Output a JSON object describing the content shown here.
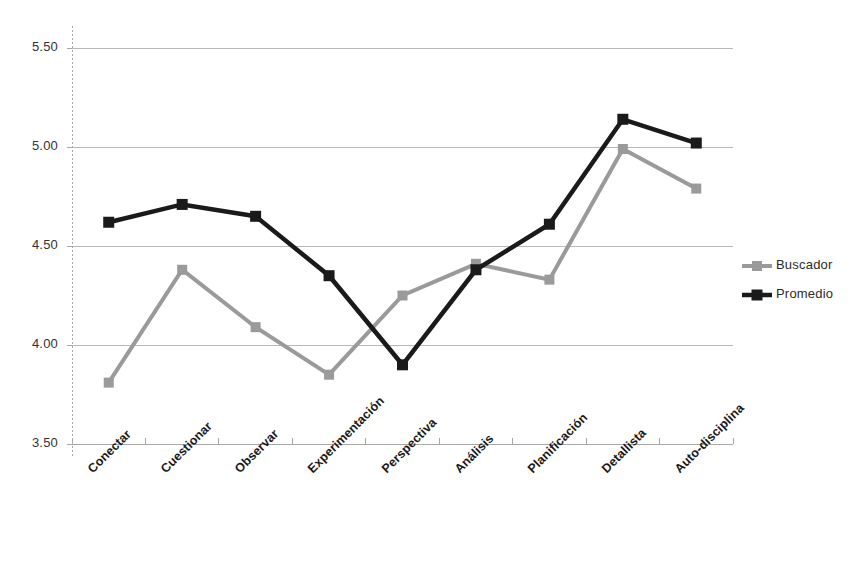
{
  "chart_data": {
    "type": "line",
    "title": "",
    "subtitle": "",
    "xlabel": "",
    "ylabel": "",
    "ylim": [
      3.5,
      5.5
    ],
    "ytick_labels": [
      "5.50",
      "5.00",
      "4.50",
      "4.00",
      "3.50"
    ],
    "ytick_values": [
      5.5,
      5.0,
      4.5,
      4.0,
      3.5
    ],
    "grid": true,
    "grid_axis": "y",
    "legend_position": "right",
    "categories": [
      "Conectar",
      "Cuestionar",
      "Observar",
      "Experimentación",
      "Perspectiva",
      "Análisis",
      "Planificación",
      "Detallista",
      "Auto-disciplina"
    ],
    "series": [
      {
        "name": "Buscador",
        "color": "#9a9a9a",
        "marker": "square",
        "values": [
          3.81,
          4.38,
          4.09,
          3.85,
          4.25,
          4.41,
          4.33,
          4.99,
          4.79
        ]
      },
      {
        "name": "Promedio",
        "color": "#1a1a1a",
        "marker": "square",
        "values": [
          4.62,
          4.71,
          4.65,
          4.35,
          3.9,
          4.38,
          4.61,
          5.14,
          5.02
        ]
      }
    ]
  },
  "legend": {
    "entries": [
      {
        "label": "Buscador"
      },
      {
        "label": "Promedio"
      }
    ]
  },
  "colors": {
    "series_gray": "#9a9a9a",
    "series_black": "#1a1a1a",
    "gridline": "#b9b9b9",
    "axis": "#a8a8a8",
    "text": "#2b2b2b"
  }
}
